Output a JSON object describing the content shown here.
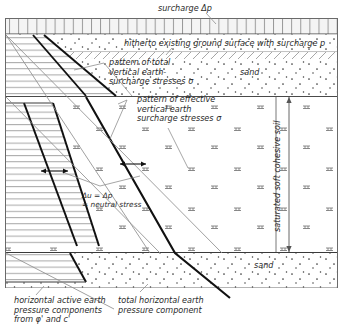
{
  "figure": {
    "type": "geotechnical-earth-pressure-diagram",
    "title_top": "surcharge Δp",
    "labels": {
      "surcharge_top": "surcharge Δp",
      "existing_ground_surface": "hitherto existing ground surface with surcharge p",
      "pattern_total": "pattern of total\nvertical earth-\nsurcharge stresses σ",
      "pattern_effective": "pattern of effective\nvertical earth\nsurcharge stresses σ",
      "neutral_stress": "Δu = Δp\n= neutral stress",
      "horizontal_active": "horizontal active earth\npressure components\nfrom φ' and c'",
      "total_horizontal": "total horizontal earth\npressure component",
      "sand_upper": "sand",
      "sand_lower": "sand",
      "cohesive_soil": "saturated soft cohesive soil"
    },
    "colors": {
      "ink": "#2b2b2b",
      "heavy_line": "#111111",
      "thin_line": "#8a8a8a",
      "hatch": "#9a9a9a",
      "fill": "#ffffff",
      "surcharge_band": "#f2f2f2"
    },
    "layers": [
      {
        "name": "surcharge-band",
        "y_top": 18,
        "y_bottom": 33
      },
      {
        "name": "sand-upper",
        "y_top": 35,
        "y_bottom": 97
      },
      {
        "name": "saturated-soft-cohesive-soil",
        "y_top": 97,
        "y_bottom": 253
      },
      {
        "name": "sand-lower",
        "y_top": 253,
        "y_bottom": 288
      }
    ]
  }
}
